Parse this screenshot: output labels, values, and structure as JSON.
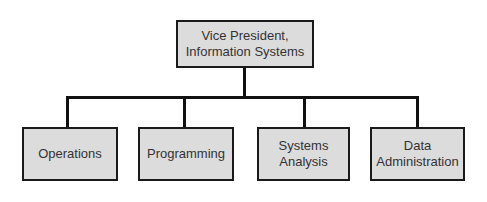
{
  "chart": {
    "type": "org-chart",
    "root": {
      "label_line1": "Vice President,",
      "label_line2": "Information Systems"
    },
    "children": [
      {
        "label_line1": "Operations",
        "label_line2": ""
      },
      {
        "label_line1": "Programming",
        "label_line2": ""
      },
      {
        "label_line1": "Systems",
        "label_line2": "Analysis"
      },
      {
        "label_line1": "Data",
        "label_line2": "Administration"
      }
    ]
  },
  "colors": {
    "box_fill": "#dcdcdc",
    "border": "#1a1a1a",
    "text": "#333333",
    "connector": "#111111"
  }
}
